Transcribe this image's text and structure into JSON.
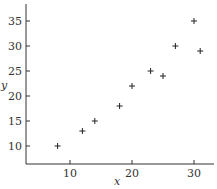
{
  "chart_data": {
    "type": "scatter",
    "title": "",
    "xlabel": "x",
    "ylabel": "y",
    "xlim": [
      3,
      33
    ],
    "ylim": [
      6.5,
      38
    ],
    "xticks": [
      10,
      20,
      30
    ],
    "yticks": [
      10,
      15,
      20,
      25,
      30,
      35
    ],
    "grid": false,
    "legend": null,
    "marker": "+",
    "points": [
      {
        "x": 8,
        "y": 10
      },
      {
        "x": 12,
        "y": 13
      },
      {
        "x": 14,
        "y": 15
      },
      {
        "x": 18,
        "y": 18
      },
      {
        "x": 20,
        "y": 22
      },
      {
        "x": 23,
        "y": 25
      },
      {
        "x": 25,
        "y": 24
      },
      {
        "x": 27,
        "y": 30
      },
      {
        "x": 30,
        "y": 35
      },
      {
        "x": 31,
        "y": 29
      }
    ]
  },
  "colors": {
    "axis": "#333333",
    "marker": "#222222"
  }
}
